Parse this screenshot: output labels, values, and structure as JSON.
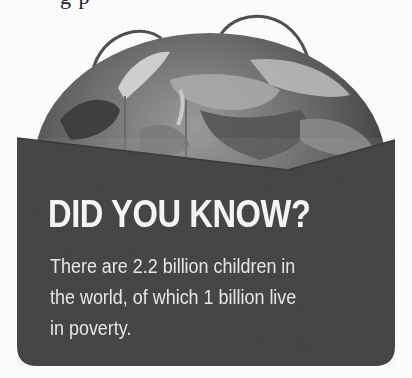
{
  "header": {
    "cropped_text": "                     g                          p"
  },
  "illustration": {
    "subject": "globe-in-pocket-icon",
    "colors": {
      "background": "#fbfbfb",
      "pocket": "#4a4a4a",
      "globe_dark": "#3a3a3a",
      "globe_light": "#8a8a8a",
      "handle": "#555555"
    }
  },
  "card": {
    "headline": "DID YOU KNOW?",
    "body_lines": [
      "There are 2.2 billion children in",
      "the world, of which 1 billion live",
      "in poverty."
    ],
    "text_color": "#f2f2f2"
  }
}
